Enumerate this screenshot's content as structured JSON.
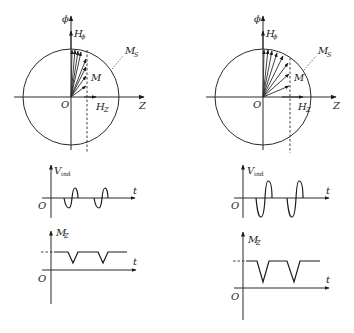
{
  "figure": {
    "panels": [
      {
        "id": "left",
        "vector_diagram": {
          "vertical_axis_label": "ϕ",
          "horizontal_axis_label": "Z",
          "origin_label": "O",
          "field_phi_label": "H",
          "field_phi_sub": "ϕ",
          "field_z_label": "H",
          "field_z_sub": "Z",
          "magnetization_label": "M",
          "saturation_label": "M",
          "saturation_sub": "S"
        },
        "vind_plot": {
          "y_label": "V",
          "y_sub": "ind",
          "x_label": "t",
          "origin_label": "O"
        },
        "mz_plot": {
          "y_label": "M",
          "y_sub": "Z",
          "x_label": "t",
          "origin_label": "O"
        }
      },
      {
        "id": "right",
        "vector_diagram": {
          "vertical_axis_label": "ϕ",
          "horizontal_axis_label": "Z",
          "origin_label": "O",
          "field_phi_label": "H",
          "field_phi_sub": "ϕ",
          "field_z_label": "H",
          "field_z_sub": "Z",
          "magnetization_label": "M",
          "saturation_label": "M",
          "saturation_sub": "S"
        },
        "vind_plot": {
          "y_label": "V",
          "y_sub": "ind",
          "x_label": "t",
          "origin_label": "O"
        },
        "mz_plot": {
          "y_label": "M",
          "y_sub": "Z",
          "x_label": "t",
          "origin_label": "O"
        }
      }
    ]
  }
}
